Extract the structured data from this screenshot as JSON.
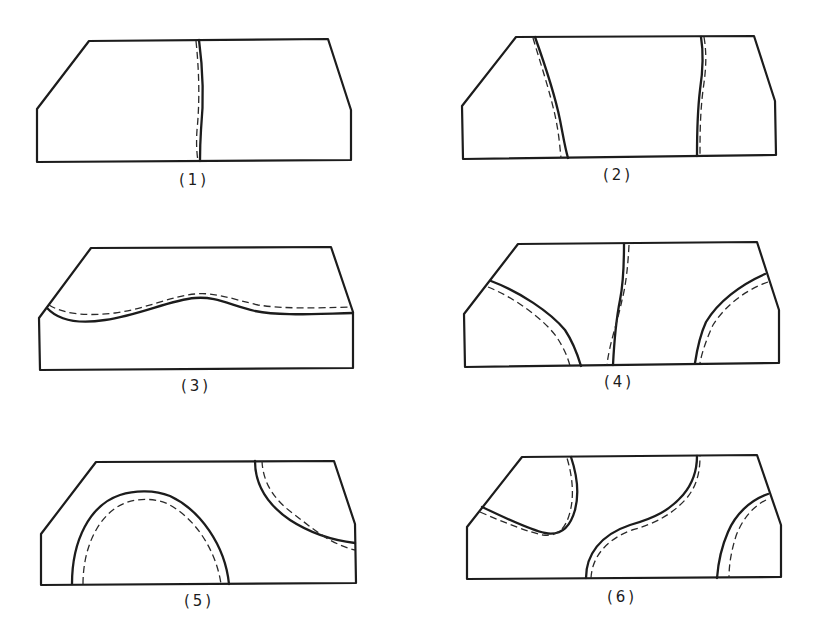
{
  "diagram": {
    "type": "grid of six specimen outline sketches",
    "stroke_color": "#1c1c1c",
    "background": "#ffffff",
    "legend_implied": {
      "solid_line": "boundary (solid)",
      "dashed_line": "offset boundary (dashed)"
    },
    "panels": [
      {
        "id": 1,
        "label": "(1)",
        "curves": [
          "single near-vertical line at center with dashed line just left of it"
        ]
      },
      {
        "id": 2,
        "label": "(2)",
        "curves": [
          "slanted line from upper-left to lower-center-left with dashed companion",
          "near-vertical line on right with dashed companion"
        ]
      },
      {
        "id": 3,
        "label": "(3)",
        "curves": [
          "wavy horizontal line across upper-middle with dashed companion above"
        ]
      },
      {
        "id": 4,
        "label": "(4)",
        "curves": [
          "arc from left bevel down to bottom",
          "near-vertical line in center",
          "arc from right bevel down to bottom"
        ]
      },
      {
        "id": 5,
        "label": "(5)",
        "curves": [
          "semicircular arch on bottom-left",
          "arc in top-right corner sweeping to right edge"
        ]
      },
      {
        "id": 6,
        "label": "(6)",
        "curves": [
          "U-shaped loop from left bevel to top",
          "S-curve from bottom-center to top-right",
          "arc from right bevel to bottom-right"
        ]
      }
    ]
  }
}
